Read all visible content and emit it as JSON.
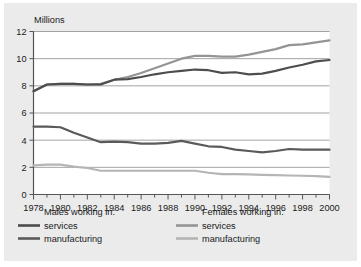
{
  "chart_data": {
    "type": "line",
    "title": "",
    "subtitle": "",
    "xlabel": "",
    "ylabel": "Millions",
    "xlim": [
      1978,
      2000
    ],
    "ylim": [
      0,
      12
    ],
    "grid": "horizontal",
    "legend_position": "bottom",
    "x": [
      1978,
      1979,
      1980,
      1981,
      1982,
      1983,
      1984,
      1985,
      1986,
      1987,
      1988,
      1989,
      1990,
      1991,
      1992,
      1993,
      1994,
      1995,
      1996,
      1997,
      1998,
      1999,
      2000
    ],
    "xticks": [
      "1978",
      "1980",
      "1982",
      "1984",
      "1986",
      "1988",
      "1990",
      "1992",
      "1994",
      "1996",
      "1998",
      "2000"
    ],
    "xtick_values": [
      1978,
      1980,
      1982,
      1984,
      1986,
      1988,
      1990,
      1992,
      1994,
      1996,
      1998,
      2000
    ],
    "yticks": [
      "0",
      "2",
      "4",
      "6",
      "8",
      "10",
      "12"
    ],
    "ytick_values": [
      0,
      2,
      4,
      6,
      8,
      10,
      12
    ],
    "series": [
      {
        "name": "Males working in: services",
        "group": "Males working in:",
        "label": "services",
        "color": "#4d4d4d",
        "width": 2.2,
        "values": [
          7.6,
          8.1,
          8.15,
          8.15,
          8.1,
          8.1,
          8.45,
          8.5,
          8.65,
          8.85,
          9.0,
          9.1,
          9.2,
          9.15,
          8.95,
          9.0,
          8.85,
          8.9,
          9.1,
          9.35,
          9.55,
          9.8,
          9.9
        ]
      },
      {
        "name": "Males working in: manufacturing",
        "group": "Males working in:",
        "label": "manufacturing",
        "color": "#5a5a5a",
        "width": 2.2,
        "values": [
          5.0,
          5.0,
          4.95,
          4.55,
          4.2,
          3.85,
          3.9,
          3.85,
          3.75,
          3.75,
          3.8,
          3.95,
          3.75,
          3.55,
          3.5,
          3.3,
          3.2,
          3.1,
          3.2,
          3.35,
          3.3,
          3.3,
          3.3
        ]
      },
      {
        "name": "Females working in: services",
        "group": "Females working in:",
        "label": "services",
        "color": "#949494",
        "width": 2.2,
        "values": [
          7.6,
          8.1,
          8.15,
          8.15,
          8.1,
          8.15,
          8.45,
          8.65,
          8.95,
          9.3,
          9.65,
          10.0,
          10.2,
          10.2,
          10.15,
          10.15,
          10.3,
          10.5,
          10.7,
          11.0,
          11.05,
          11.2,
          11.35
        ]
      },
      {
        "name": "Females working in: manufacturing",
        "group": "Females working in:",
        "label": "manufacturing",
        "color": "#b5b5b5",
        "width": 2.2,
        "values": [
          2.15,
          2.2,
          2.2,
          2.05,
          1.95,
          1.75,
          1.75,
          1.75,
          1.75,
          1.75,
          1.75,
          1.75,
          1.75,
          1.6,
          1.5,
          1.5,
          1.48,
          1.45,
          1.42,
          1.4,
          1.38,
          1.35,
          1.3
        ]
      }
    ]
  },
  "legend": {
    "columns": [
      {
        "heading": "Males working in:",
        "entries": [
          {
            "label": "services",
            "color": "#4d4d4d"
          },
          {
            "label": "manufacturing",
            "color": "#5a5a5a"
          }
        ]
      },
      {
        "heading": "Females working in:",
        "entries": [
          {
            "label": "services",
            "color": "#949494"
          },
          {
            "label": "manufacturing",
            "color": "#b5b5b5"
          }
        ]
      }
    ]
  },
  "colors": {
    "panel_background": "#ebebeb",
    "plot_background": "#ffffff",
    "axis": "#555555",
    "gridline": "#8c8c8c",
    "text": "#1a1a1a"
  }
}
